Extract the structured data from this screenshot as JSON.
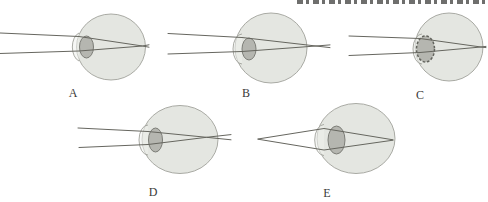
{
  "panels": [
    {
      "id": "A",
      "label": "A"
    },
    {
      "id": "B",
      "label": "B"
    },
    {
      "id": "C",
      "label": "C"
    },
    {
      "id": "D",
      "label": "D"
    },
    {
      "id": "E",
      "label": "E"
    }
  ],
  "colors": {
    "background": "#ffffff",
    "eyeball_fill": "#e4e6e1",
    "eyeball_stroke": "#a0a19b",
    "cornea_fill": "#eef0ec",
    "lens_fill": "#b5b6b0",
    "lens_stroke": "#7c7d77",
    "ray": "#66665f",
    "label_text": "#3a3a38",
    "cropped_header_ink": "#4a4a48"
  }
}
